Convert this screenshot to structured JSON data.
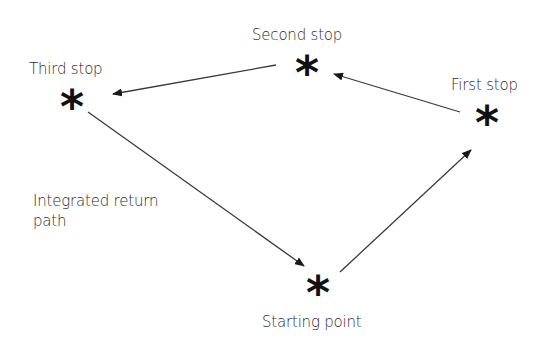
{
  "diagram": {
    "type": "navigation-path",
    "nodes": [
      {
        "id": "start",
        "label": "Starting point",
        "marker": "*"
      },
      {
        "id": "first",
        "label": "First stop",
        "marker": "*"
      },
      {
        "id": "second",
        "label": "Second stop",
        "marker": "*"
      },
      {
        "id": "third",
        "label": "Third stop",
        "marker": "*"
      }
    ],
    "edges": [
      {
        "from": "start",
        "to": "first",
        "label": ""
      },
      {
        "from": "first",
        "to": "second",
        "label": ""
      },
      {
        "from": "second",
        "to": "third",
        "label": ""
      },
      {
        "from": "third",
        "to": "start",
        "label_line1": "Integrated return",
        "label_line2": "path"
      }
    ],
    "colors": {
      "line": "#3a3a3a",
      "marker": "#111111",
      "text": "#2c2c2c",
      "background": "#ffffff"
    }
  }
}
